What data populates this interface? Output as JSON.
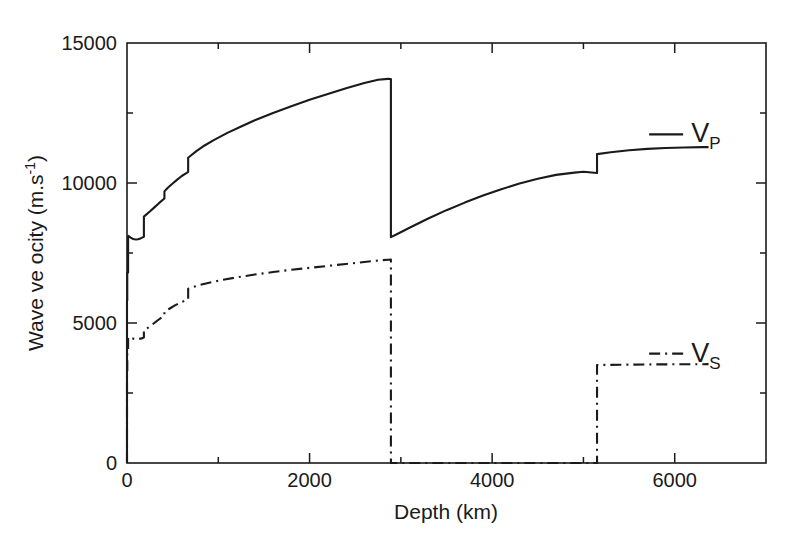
{
  "chart_data": {
    "type": "line",
    "title": "",
    "xlabel": "Depth (km)",
    "ylabel_main": "Wave ve ocity (m.s",
    "ylabel_exponent": "-1",
    "ylabel_close": ")",
    "xlim": [
      0,
      7000
    ],
    "ylim": [
      0,
      15000
    ],
    "grid": false,
    "legend_position": "inline-right",
    "xticks_major": [
      0,
      2000,
      4000,
      6000
    ],
    "xtick_labels": [
      "0",
      "2000",
      "4000",
      "6000"
    ],
    "xticks_minor": [
      1000,
      3000,
      5000,
      7000
    ],
    "yticks_major": [
      0,
      5000,
      10000,
      15000
    ],
    "ytick_labels": [
      "0",
      "5000",
      "10000",
      "15000"
    ],
    "yticks_minor": [
      2500,
      7500,
      12500
    ],
    "series": [
      {
        "name": "Vp",
        "label_main": "V",
        "label_sub": "P",
        "linestyle": "solid",
        "color": "#1a1a1a",
        "label_x": 6180,
        "label_y": 11450,
        "points": [
          [
            0,
            0
          ],
          [
            0,
            5800
          ],
          [
            3,
            5800
          ],
          [
            3,
            6800
          ],
          [
            12,
            6800
          ],
          [
            12,
            8080
          ],
          [
            15,
            8110
          ],
          [
            24,
            8090
          ],
          [
            40,
            8050
          ],
          [
            60,
            8010
          ],
          [
            80,
            7990
          ],
          [
            100,
            7980
          ],
          [
            120,
            7990
          ],
          [
            140,
            8010
          ],
          [
            160,
            8040
          ],
          [
            185,
            8080
          ],
          [
            185,
            8800
          ],
          [
            210,
            8870
          ],
          [
            250,
            8980
          ],
          [
            300,
            9130
          ],
          [
            350,
            9280
          ],
          [
            400,
            9420
          ],
          [
            410,
            9450
          ],
          [
            410,
            9700
          ],
          [
            450,
            9840
          ],
          [
            500,
            9980
          ],
          [
            550,
            10120
          ],
          [
            600,
            10250
          ],
          [
            650,
            10350
          ],
          [
            670,
            10400
          ],
          [
            670,
            10900
          ],
          [
            700,
            10980
          ],
          [
            760,
            11140
          ],
          [
            850,
            11340
          ],
          [
            950,
            11530
          ],
          [
            1100,
            11790
          ],
          [
            1250,
            12020
          ],
          [
            1400,
            12240
          ],
          [
            1600,
            12500
          ],
          [
            1800,
            12740
          ],
          [
            2000,
            12970
          ],
          [
            2200,
            13180
          ],
          [
            2400,
            13380
          ],
          [
            2600,
            13570
          ],
          [
            2750,
            13690
          ],
          [
            2860,
            13720
          ],
          [
            2891,
            13716
          ],
          [
            2891,
            8065
          ],
          [
            2950,
            8160
          ],
          [
            3100,
            8410
          ],
          [
            3300,
            8730
          ],
          [
            3500,
            9030
          ],
          [
            3700,
            9300
          ],
          [
            3900,
            9550
          ],
          [
            4100,
            9780
          ],
          [
            4300,
            9980
          ],
          [
            4500,
            10150
          ],
          [
            4700,
            10290
          ],
          [
            4900,
            10370
          ],
          [
            5000,
            10400
          ],
          [
            5149,
            10355
          ],
          [
            5149,
            11030
          ],
          [
            5300,
            11100
          ],
          [
            5500,
            11170
          ],
          [
            5700,
            11220
          ],
          [
            5900,
            11250
          ],
          [
            6100,
            11270
          ],
          [
            6300,
            11280
          ],
          [
            6371,
            11280
          ]
        ]
      },
      {
        "name": "Vs",
        "label_main": "V",
        "label_sub": "S",
        "linestyle": "dashdot",
        "color": "#1a1a1a",
        "label_x": 6180,
        "label_y": 3620,
        "points": [
          [
            0,
            0
          ],
          [
            0,
            3200
          ],
          [
            3,
            3200
          ],
          [
            3,
            3900
          ],
          [
            12,
            3900
          ],
          [
            12,
            4480
          ],
          [
            15,
            4490
          ],
          [
            40,
            4470
          ],
          [
            70,
            4440
          ],
          [
            100,
            4420
          ],
          [
            130,
            4430
          ],
          [
            160,
            4450
          ],
          [
            185,
            4480
          ],
          [
            185,
            4750
          ],
          [
            230,
            4830
          ],
          [
            280,
            4950
          ],
          [
            330,
            5080
          ],
          [
            380,
            5200
          ],
          [
            410,
            5260
          ],
          [
            410,
            5400
          ],
          [
            460,
            5500
          ],
          [
            520,
            5620
          ],
          [
            580,
            5720
          ],
          [
            640,
            5800
          ],
          [
            670,
            5840
          ],
          [
            670,
            6220
          ],
          [
            720,
            6280
          ],
          [
            800,
            6360
          ],
          [
            900,
            6440
          ],
          [
            1050,
            6540
          ],
          [
            1200,
            6630
          ],
          [
            1400,
            6730
          ],
          [
            1600,
            6820
          ],
          [
            1800,
            6900
          ],
          [
            2000,
            6970
          ],
          [
            2200,
            7040
          ],
          [
            2400,
            7110
          ],
          [
            2600,
            7180
          ],
          [
            2750,
            7230
          ],
          [
            2860,
            7260
          ],
          [
            2891,
            7265
          ],
          [
            2891,
            0
          ],
          [
            5149,
            0
          ],
          [
            5149,
            3500
          ],
          [
            5400,
            3510
          ],
          [
            5700,
            3520
          ],
          [
            6000,
            3525
          ],
          [
            6371,
            3530
          ]
        ]
      }
    ]
  },
  "plot_geometry": {
    "left_px": 127,
    "right_px": 766,
    "top_px": 43,
    "bottom_px": 463
  },
  "colors": {
    "axis": "#1a1a1a",
    "background": "#ffffff",
    "vp_line": "#1a1a1a",
    "vs_line": "#1a1a1a"
  }
}
